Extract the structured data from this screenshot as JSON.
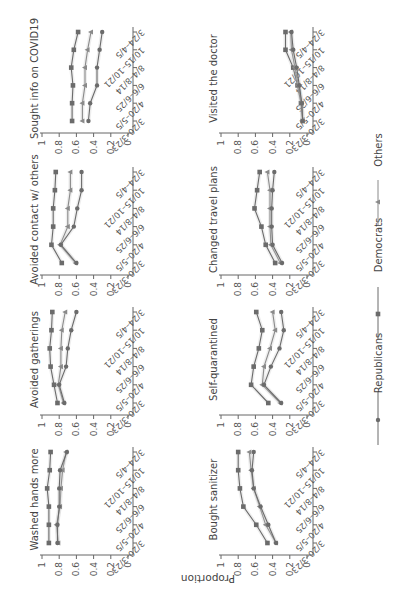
{
  "chart_data": {
    "type": "line",
    "orientation_note": "figure displayed rotated; value axis horizontal (1 left, 0 right), dates vertical (first at bottom)",
    "ylabel": "Proportion",
    "ylim": [
      0,
      1
    ],
    "yticks": [
      "0",
      "0.2",
      "0.4",
      "0.6",
      "0.8",
      "1"
    ],
    "categories": [
      "3/20–3/23",
      "4/20–5/5",
      "6/6–6/25",
      "8/4–8/14",
      "10/15–10/21",
      "3/24–4/5"
    ],
    "legend": [
      {
        "name": "Republicans",
        "marker": "circle"
      },
      {
        "name": "Democrats",
        "marker": "square"
      },
      {
        "name": "Others",
        "marker": "triangle"
      }
    ],
    "colors": {
      "Republicans": "#6b6b6b",
      "Democrats": "#6b6b6b",
      "Others": "#8a8a8a",
      "axis": "#666666",
      "band": "#bbbbbb"
    },
    "panels": [
      {
        "title": "Sought info on COVID19",
        "series": {
          "Democrats": [
            0.65,
            0.65,
            0.64,
            0.66,
            0.63,
            0.58
          ],
          "Others": [
            0.53,
            0.53,
            0.5,
            0.5,
            0.47,
            0.43
          ],
          "Republicans": [
            0.46,
            0.44,
            0.36,
            0.36,
            0.33,
            0.3
          ]
        }
      },
      {
        "title": "Visited the doctor",
        "series": {
          "Democrats": [
            0.05,
            0.07,
            0.11,
            0.16,
            0.25,
            0.25
          ],
          "Others": [
            0.05,
            0.06,
            0.1,
            0.14,
            0.18,
            0.19
          ],
          "Republicans": [
            0.05,
            0.06,
            0.09,
            0.12,
            0.16,
            0.18
          ]
        }
      },
      {
        "title": "Avoided contact w/ others",
        "series": {
          "Democrats": [
            0.77,
            0.89,
            0.87,
            0.87,
            0.85,
            0.84
          ],
          "Others": [
            0.61,
            0.79,
            0.7,
            0.7,
            0.67,
            0.67
          ],
          "Republicans": [
            0.6,
            0.78,
            0.63,
            0.59,
            0.54,
            0.54
          ]
        }
      },
      {
        "title": "Changed travel plans",
        "series": {
          "Democrats": [
            0.37,
            0.48,
            0.53,
            0.61,
            0.58,
            0.55
          ],
          "Others": [
            0.31,
            0.42,
            0.43,
            0.43,
            0.43,
            0.46
          ],
          "Republicans": [
            0.29,
            0.4,
            0.41,
            0.41,
            0.4,
            0.38
          ]
        }
      },
      {
        "title": "Avoided gatherings",
        "series": {
          "Democrats": [
            0.82,
            0.86,
            0.9,
            0.91,
            0.89,
            0.88
          ],
          "Others": [
            0.75,
            0.81,
            0.78,
            0.78,
            0.77,
            0.73
          ],
          "Republicans": [
            0.74,
            0.8,
            0.72,
            0.7,
            0.66,
            0.6
          ]
        }
      },
      {
        "title": "Self-quarantined",
        "series": {
          "Democrats": [
            0.45,
            0.65,
            0.62,
            0.56,
            0.52,
            0.59
          ],
          "Others": [
            0.31,
            0.52,
            0.5,
            0.43,
            0.37,
            0.4
          ],
          "Republicans": [
            0.3,
            0.5,
            0.42,
            0.32,
            0.27,
            0.3
          ]
        }
      },
      {
        "title": "Washed hands more",
        "series": {
          "Democrats": [
            0.92,
            0.92,
            0.92,
            0.94,
            0.91,
            0.9
          ],
          "Others": [
            0.81,
            0.83,
            0.79,
            0.78,
            0.76,
            0.72
          ],
          "Republicans": [
            0.82,
            0.82,
            0.8,
            0.8,
            0.79,
            0.71
          ]
        }
      },
      {
        "title": "Bought sanitizer",
        "series": {
          "Democrats": [
            0.46,
            0.59,
            0.74,
            0.78,
            0.8,
            0.8
          ],
          "Others": [
            0.36,
            0.48,
            0.55,
            0.62,
            0.65,
            0.67
          ],
          "Republicans": [
            0.36,
            0.45,
            0.54,
            0.62,
            0.64,
            0.62
          ]
        }
      }
    ]
  }
}
